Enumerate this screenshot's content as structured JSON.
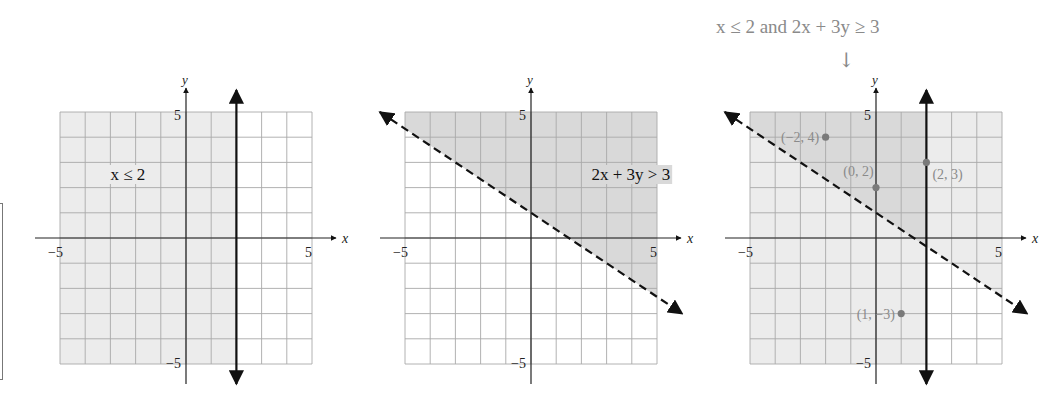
{
  "caption": {
    "text": "x ≤ 2 and 2x + 3y ≥ 3",
    "arrow": "↓"
  },
  "colors": {
    "grid": "#a9a9a9",
    "axis": "#222222",
    "shade_light": "#ececec",
    "shade_dark": "#d9d9d9",
    "boundary": "#111111",
    "point": "#7a7a7a",
    "point_label": "#8a8a8a"
  },
  "chart_data": [
    {
      "type": "inequality-graph",
      "title": "x ≤ 2",
      "inequality": "x ≤ 2",
      "xlim": [
        -5,
        5
      ],
      "ylim": [
        -5,
        5
      ],
      "xlabel": "x",
      "ylabel": "y",
      "tick_labels": {
        "x_min": "−5",
        "x_max": "5",
        "y_min": "−5",
        "y_max": "5"
      },
      "grid": true,
      "boundary": {
        "kind": "vertical",
        "x": 2,
        "style": "solid"
      },
      "shaded_region": "left of x = 2",
      "label": {
        "text": "x ≤ 2",
        "x": -3,
        "y": 2.5
      },
      "box": {
        "left": 60,
        "top": 112,
        "size": 252
      },
      "points": []
    },
    {
      "type": "inequality-graph",
      "title": "2x + 3y > 3",
      "inequality": "2x + 3y > 3",
      "xlim": [
        -5,
        5
      ],
      "ylim": [
        -5,
        5
      ],
      "xlabel": "x",
      "ylabel": "y",
      "tick_labels": {
        "x_min": "−5",
        "x_max": "5",
        "y_min": "−5",
        "y_max": "5"
      },
      "grid": true,
      "boundary": {
        "kind": "line",
        "equation": "2x + 3y = 3",
        "slope": -0.6667,
        "intercept": 1,
        "style": "dashed"
      },
      "shaded_region": "above line 2x + 3y = 3",
      "label": {
        "text": "2x + 3y > 3",
        "x": 2.4,
        "y": 2.5
      },
      "box": {
        "left": 405,
        "top": 112,
        "size": 252
      },
      "points": []
    },
    {
      "type": "inequality-graph",
      "title": "x ≤ 2 and 2x + 3y ≥ 3",
      "inequality": "x ≤ 2 and 2x + 3y ≥ 3",
      "xlim": [
        -5,
        5
      ],
      "ylim": [
        -5,
        5
      ],
      "xlabel": "x",
      "ylabel": "y",
      "tick_labels": {
        "x_min": "−5",
        "x_max": "5",
        "y_min": "−5",
        "y_max": "5"
      },
      "grid": true,
      "boundaries": [
        {
          "kind": "vertical",
          "x": 2,
          "style": "solid"
        },
        {
          "kind": "line",
          "equation": "2x + 3y = 3",
          "slope": -0.6667,
          "intercept": 1,
          "style": "dashed"
        }
      ],
      "shaded_region": "overlap: x ≤ 2 and above line (darker)",
      "box": {
        "left": 750,
        "top": 112,
        "size": 252
      },
      "points": [
        {
          "x": -2,
          "y": 4,
          "label": "(−2, 4)",
          "label_side": "left"
        },
        {
          "x": 0,
          "y": 2,
          "label": "(0, 2)",
          "label_side": "above-left"
        },
        {
          "x": 2,
          "y": 3,
          "label": "(2, 3)",
          "label_side": "below-right"
        },
        {
          "x": 1,
          "y": -3,
          "label": "(1, −3)",
          "label_side": "left"
        }
      ]
    }
  ]
}
